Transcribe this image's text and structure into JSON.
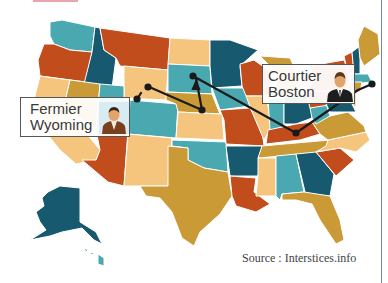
{
  "map": {
    "title": "",
    "colors": {
      "dark_teal": "#17596f",
      "light_teal": "#4aa8b0",
      "rust": "#c24d1c",
      "peach": "#f6c57d",
      "mustard": "#c99a35",
      "route": "#1a1a1a",
      "border_line": "#6f88a8"
    }
  },
  "labels": {
    "farmer": {
      "line1": "Fermier",
      "line2": "Wyoming",
      "icon": "farmer-avatar-icon"
    },
    "courier": {
      "line1": "Courtier",
      "line2": "Boston",
      "icon": "businessman-avatar-icon"
    }
  },
  "route": {
    "description": "Path from Wyoming through Nebraska, South Dakota, Kentucky to Boston"
  },
  "source": "Source : Interstices.info"
}
